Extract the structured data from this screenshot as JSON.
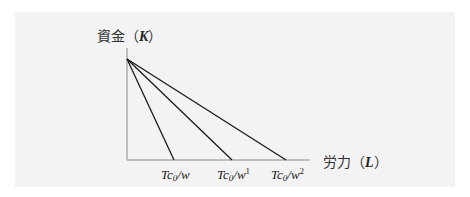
{
  "diagram": {
    "type": "isocost-lines",
    "y_axis": {
      "label_prefix": "資金（",
      "label_var": "K",
      "label_suffix": "）"
    },
    "x_axis": {
      "label_prefix": "労力（",
      "label_var": "L",
      "label_suffix": "）"
    },
    "origin": {
      "x": 127,
      "y": 160
    },
    "apex": {
      "x": 127,
      "y": 59
    },
    "x_axis_end": 310,
    "lines": [
      {
        "end_x": 174,
        "label_main": "Tc",
        "label_sub": "0",
        "label_tail": "/w",
        "label_sup": ""
      },
      {
        "end_x": 232,
        "label_main": "Tc",
        "label_sub": "0",
        "label_tail": "/w",
        "label_sup": "1"
      },
      {
        "end_x": 286,
        "label_main": "Tc",
        "label_sub": "0",
        "label_tail": "/w",
        "label_sup": "2"
      }
    ],
    "colors": {
      "line": "#1a1a1a",
      "axis": "#888888",
      "background": "#f3f3f3"
    }
  }
}
